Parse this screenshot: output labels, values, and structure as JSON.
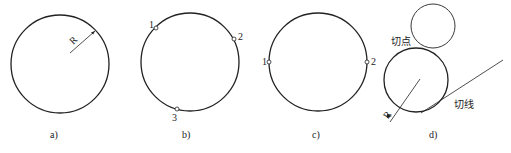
{
  "figures": {
    "a": {
      "caption": "a)",
      "radius_label": "R"
    },
    "b": {
      "caption": "b)",
      "points": [
        "1",
        "2",
        "3"
      ]
    },
    "c": {
      "caption": "c)",
      "points": [
        "1",
        "2"
      ]
    },
    "d": {
      "caption": "d)",
      "radius_label": "R",
      "tangent_point_label": "切点",
      "tangent_line_label": "切线"
    }
  },
  "colors": {
    "stroke": "#222222",
    "background": "#ffffff"
  }
}
